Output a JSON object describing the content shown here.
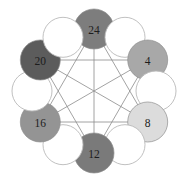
{
  "background_color": "#ffffff",
  "edge_color": "#8c8c8c",
  "empty_node": {
    "fill": "#ffffff",
    "stroke": "#b9b9b9",
    "radius": 20
  },
  "label_color": "#1d1d1d",
  "chart_data": {
    "type": "diagram",
    "graph_type": "circular-node-link-ring",
    "title": "",
    "layout_hint": "12 circles evenly spaced on a ring; 6 labeled filled nodes alternate with 6 unlabeled empty circles; all 15 pairwise edges drawn between the 6 labeled nodes (complete graph K6)",
    "ring_center": [
      94,
      91
    ],
    "ring_radius": 62,
    "node_radius": 20,
    "slot_count": 12,
    "nodes": [
      {
        "id": "n-24",
        "label": "24",
        "value": 24,
        "filled": true,
        "fill": "#7d7d7d",
        "slot": 0,
        "angle_deg": -90,
        "cx": 94,
        "cy": 29
      },
      {
        "id": "empty-1",
        "label": "",
        "value": null,
        "filled": false,
        "fill": "#ffffff",
        "slot": 1,
        "angle_deg": -60,
        "cx": 125,
        "cy": 37.3
      },
      {
        "id": "n-4",
        "label": "4",
        "value": 4,
        "filled": true,
        "fill": "#a8a8a8",
        "slot": 2,
        "angle_deg": -30,
        "cx": 147.7,
        "cy": 60
      },
      {
        "id": "empty-3",
        "label": "",
        "value": null,
        "filled": false,
        "fill": "#ffffff",
        "slot": 3,
        "angle_deg": 0,
        "cx": 156,
        "cy": 91
      },
      {
        "id": "n-8",
        "label": "8",
        "value": 8,
        "filled": true,
        "fill": "#dcdcdc",
        "slot": 4,
        "angle_deg": 30,
        "cx": 147.7,
        "cy": 122
      },
      {
        "id": "empty-5",
        "label": "",
        "value": null,
        "filled": false,
        "fill": "#ffffff",
        "slot": 5,
        "angle_deg": 60,
        "cx": 125,
        "cy": 144.7
      },
      {
        "id": "n-12",
        "label": "12",
        "value": 12,
        "filled": true,
        "fill": "#7a7a7a",
        "slot": 6,
        "angle_deg": 90,
        "cx": 94,
        "cy": 153
      },
      {
        "id": "empty-7",
        "label": "",
        "value": null,
        "filled": false,
        "fill": "#ffffff",
        "slot": 7,
        "angle_deg": 120,
        "cx": 63,
        "cy": 144.7
      },
      {
        "id": "n-16",
        "label": "16",
        "value": 16,
        "filled": true,
        "fill": "#949494",
        "slot": 8,
        "angle_deg": 150,
        "cx": 40.3,
        "cy": 122
      },
      {
        "id": "empty-9",
        "label": "",
        "value": null,
        "filled": false,
        "fill": "#ffffff",
        "slot": 9,
        "angle_deg": 180,
        "cx": 32,
        "cy": 91
      },
      {
        "id": "n-20",
        "label": "20",
        "value": 20,
        "filled": true,
        "fill": "#5c5c5c",
        "slot": 10,
        "angle_deg": 210,
        "cx": 40.3,
        "cy": 60
      },
      {
        "id": "empty-11",
        "label": "",
        "value": null,
        "filled": false,
        "fill": "#ffffff",
        "slot": 11,
        "angle_deg": 240,
        "cx": 63,
        "cy": 37.3
      }
    ],
    "edges": [
      {
        "from": "n-24",
        "to": "n-4"
      },
      {
        "from": "n-24",
        "to": "n-8"
      },
      {
        "from": "n-24",
        "to": "n-12"
      },
      {
        "from": "n-24",
        "to": "n-16"
      },
      {
        "from": "n-24",
        "to": "n-20"
      },
      {
        "from": "n-4",
        "to": "n-8"
      },
      {
        "from": "n-4",
        "to": "n-12"
      },
      {
        "from": "n-4",
        "to": "n-16"
      },
      {
        "from": "n-4",
        "to": "n-20"
      },
      {
        "from": "n-8",
        "to": "n-12"
      },
      {
        "from": "n-8",
        "to": "n-16"
      },
      {
        "from": "n-8",
        "to": "n-20"
      },
      {
        "from": "n-12",
        "to": "n-16"
      },
      {
        "from": "n-12",
        "to": "n-20"
      },
      {
        "from": "n-16",
        "to": "n-20"
      }
    ]
  }
}
